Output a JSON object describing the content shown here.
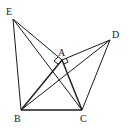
{
  "diagram": {
    "labels": {
      "A": "A",
      "B": "B",
      "C": "C",
      "D": "D",
      "E": "E"
    },
    "points": [
      "A",
      "B",
      "C",
      "D",
      "E"
    ],
    "segments": [
      "EB",
      "EA",
      "EC",
      "AB",
      "AC",
      "BC",
      "BD",
      "AD",
      "DC"
    ],
    "right_angles": [
      "EAB",
      "DAC"
    ]
  }
}
